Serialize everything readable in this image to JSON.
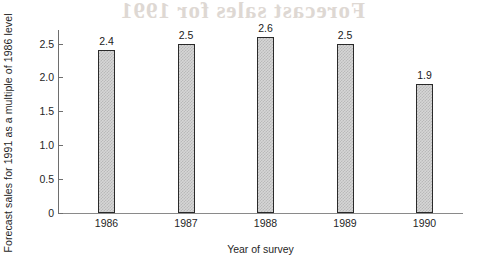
{
  "chart_data": {
    "type": "bar",
    "title": "",
    "subtitle": "",
    "xlabel": "Year of survey",
    "ylabel": "Forecast sales for 1991 as a multiple of 1986 level",
    "categories": [
      "1986",
      "1987",
      "1988",
      "1989",
      "1990"
    ],
    "values": [
      2.4,
      2.5,
      2.6,
      2.5,
      1.9
    ],
    "value_labels": [
      "2.4",
      "2.5",
      "2.6",
      "2.5",
      "1.9"
    ],
    "series": [
      {
        "name": "Forecast sales for 1991",
        "values": [
          2.4,
          2.5,
          2.6,
          2.5,
          1.9
        ]
      }
    ],
    "ylim": [
      0,
      2.7
    ],
    "ytick_values": [
      0,
      0.5,
      1.0,
      1.5,
      2.0,
      2.5
    ],
    "ytick_labels": [
      "0",
      "0.5",
      "1.0",
      "1.5",
      "2.0",
      "2.5"
    ],
    "grid": false,
    "legend": false,
    "legend_position": "none",
    "bar_fill": "#d6d6d6",
    "bar_edge": "#2a2a2a",
    "axis_color": "#6e6e6e",
    "text_color": "#1f1f1f"
  },
  "artifact": {
    "ghost_text": "Forecast sales for 1991"
  }
}
